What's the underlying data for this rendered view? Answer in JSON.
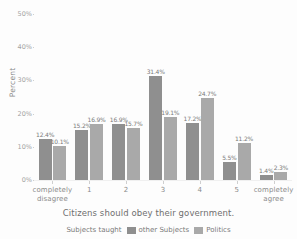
{
  "figure": {
    "clipped_title": "",
    "background_color": "#fdfdfd"
  },
  "axes": {
    "ylabel": "Percent",
    "xlabel": "Citizens should obey their government.",
    "yticks": [
      "0%",
      "10%",
      "20%",
      "30%",
      "40%",
      "50%"
    ],
    "xticks": [
      "completely\ndisagree",
      "1",
      "2",
      "3",
      "4",
      "5",
      "completely\nagree"
    ],
    "xtick_line1": [
      "completely",
      "1",
      "2",
      "3",
      "4",
      "5",
      "completely"
    ],
    "xtick_line2": [
      "disagree",
      "",
      "",
      "",
      "",
      "",
      "agree"
    ]
  },
  "legend": {
    "title": "Subjects taught",
    "entries": [
      {
        "label": "other Subjects",
        "color": "#8f8f8f"
      },
      {
        "label": "Politics",
        "color": "#a9a9a9"
      }
    ]
  },
  "chart_data": {
    "type": "bar",
    "title": "",
    "xlabel": "Citizens should obey their government.",
    "ylabel": "Percent",
    "ylim": [
      0,
      50
    ],
    "ytick_values": [
      0,
      10,
      20,
      30,
      40,
      50
    ],
    "grid": false,
    "legend_position": "bottom",
    "legend_title": "Subjects taught",
    "categories": [
      "completely disagree",
      "1",
      "2",
      "3",
      "4",
      "5",
      "completely agree"
    ],
    "series": [
      {
        "name": "other Subjects",
        "color": "#8f8f8f",
        "values": [
          12.4,
          15.2,
          16.9,
          31.4,
          17.2,
          5.5,
          1.4
        ],
        "labels": [
          "12.4%",
          "15.2%",
          "16.9%",
          "31.4%",
          "17.2%",
          "5.5%",
          "1.4%"
        ]
      },
      {
        "name": "Politics",
        "color": "#a9a9a9",
        "values": [
          10.1,
          16.9,
          15.7,
          19.1,
          24.7,
          11.2,
          2.3
        ],
        "labels": [
          "10.1%",
          "16.9%",
          "15.7%",
          "19.1%",
          "24.7%",
          "11.2%",
          "2.3%"
        ]
      }
    ]
  }
}
